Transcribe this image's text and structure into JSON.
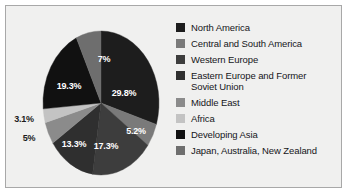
{
  "figure": {
    "background": "#ffffff",
    "panel_background": "#f0f0ef",
    "panel_border_color": "#a8a8a8"
  },
  "chart_data": {
    "type": "pie",
    "title": "",
    "xlabel": "",
    "ylabel": "",
    "grid": false,
    "legend_position": "right",
    "units": "percent",
    "start_angle_deg": 0,
    "direction": "clockwise",
    "categories": [
      "North America",
      "Central and South America",
      "Western Europe",
      "Eastern Europe and Former Soviet Union",
      "Middle East",
      "Africa",
      "Developing Asia",
      "Japan, Australia, New Zealand"
    ],
    "values": [
      29.8,
      5.2,
      17.3,
      13.3,
      5.0,
      3.1,
      19.3,
      7.0
    ],
    "value_labels": [
      "29.8%",
      "5.2%",
      "17.3%",
      "13.3%",
      "5%",
      "3.1%",
      "19.3%",
      "7%"
    ],
    "colors": [
      "#1d1d1d",
      "#7a7a7a",
      "#3d3d3d",
      "#2f2f2f",
      "#8b8b8b",
      "#c3c3c3",
      "#111111",
      "#6e6e6e"
    ],
    "label_colors": [
      "#ffffff",
      "#ffffff",
      "#ffffff",
      "#ffffff",
      "#1b1b1b",
      "#1b1b1b",
      "#ffffff",
      "#ffffff"
    ]
  },
  "slices": [
    {
      "name": "north-america",
      "label": "North America",
      "value_label": "29.8%",
      "color": "#1d1d1d",
      "label_x": 92,
      "label_y": 73,
      "label_tone": "on-dark"
    },
    {
      "name": "central-and-south-america",
      "label": "Central and South America",
      "value_label": "5.2%",
      "color": "#7a7a7a",
      "label_x": 104,
      "label_y": 111,
      "label_tone": "on-dark"
    },
    {
      "name": "western-europe",
      "label": "Western Europe",
      "value_label": "17.3%",
      "color": "#3d3d3d",
      "label_x": 74,
      "label_y": 126,
      "label_tone": "on-dark"
    },
    {
      "name": "eastern-europe-and-former-soviet-union",
      "label": "Eastern Europe and Former\nSoviet Union",
      "value_label": "13.3%",
      "color": "#2f2f2f",
      "label_x": 42,
      "label_y": 124,
      "label_tone": "on-dark"
    },
    {
      "name": "middle-east",
      "label": "Middle East",
      "value_label": "5%",
      "color": "#8b8b8b",
      "label_x": -3,
      "label_y": 118,
      "label_tone": "on-light"
    },
    {
      "name": "africa",
      "label": "Africa",
      "value_label": "3.1%",
      "color": "#c3c3c3",
      "label_x": -8,
      "label_y": 99,
      "label_tone": "on-light"
    },
    {
      "name": "developing-asia",
      "label": "Developing Asia",
      "value_label": "19.3%",
      "color": "#111111",
      "label_x": 37,
      "label_y": 66,
      "label_tone": "on-dark"
    },
    {
      "name": "japan-australia-new-zealand",
      "label": "Japan, Australia, New Zealand",
      "value_label": "7%",
      "color": "#6e6e6e",
      "label_x": 72,
      "label_y": 39,
      "label_tone": "on-dark"
    }
  ],
  "legend": {
    "items": [
      {
        "label": "North America",
        "color": "#1d1d1d"
      },
      {
        "label": "Central and South America",
        "color": "#7a7a7a"
      },
      {
        "label": "Western Europe",
        "color": "#3d3d3d"
      },
      {
        "label": "Eastern Europe and Former\nSoviet Union",
        "color": "#2f2f2f"
      },
      {
        "label": "Middle East",
        "color": "#8b8b8b"
      },
      {
        "label": "Africa",
        "color": "#c3c3c3"
      },
      {
        "label": "Developing Asia",
        "color": "#111111"
      },
      {
        "label": "Japan, Australia, New Zealand",
        "color": "#6e6e6e"
      }
    ]
  }
}
